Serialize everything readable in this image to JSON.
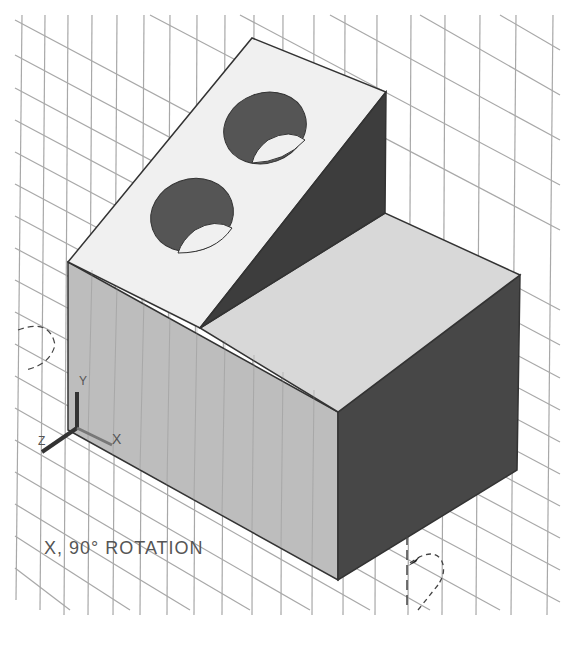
{
  "viewport": {
    "annotation": "X, 90° ROTATION",
    "background": "#ffffff",
    "grid_color": "#a8a8a8"
  },
  "model": {
    "faces": {
      "top_slab": "#efefef",
      "top_block": "#d6d6d6",
      "front_left": "#b9b9b9",
      "front_right": "#4a4a4a",
      "wedge": "#3e3e3e",
      "hole": "#5a5a5a"
    },
    "holes": 2
  },
  "ucs_icon": {
    "axes": [
      "X",
      "Y",
      "Z"
    ]
  }
}
